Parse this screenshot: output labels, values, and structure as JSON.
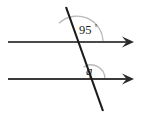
{
  "figure": {
    "background_color": "#ffffff",
    "line_color": "#3b3b3b",
    "transversal_color": "#1a1a1a",
    "arc_color": "#b9b9b9",
    "text_color": "#1c1c1c",
    "labels": {
      "upper_angle_value": "95",
      "upper_angle_degree_symbol": "°",
      "lower_angle_value": "q"
    },
    "lines": {
      "top_parallel": {
        "x1": 8,
        "y1": 42,
        "x2": 138,
        "y2": 42,
        "arrow_end": "right"
      },
      "bottom_parallel": {
        "x1": 8,
        "y1": 79,
        "x2": 138,
        "y2": 79,
        "arrow_end": "right"
      },
      "transversal": {
        "x1": 66,
        "y1": 7,
        "x2": 103,
        "y2": 111
      }
    },
    "intersections": {
      "upper": {
        "x": 77,
        "y": 42
      },
      "lower": {
        "x": 91,
        "y": 79
      }
    },
    "arcs": {
      "upper": {
        "cx": 77,
        "cy": 42,
        "radius": 26
      },
      "lower": {
        "cx": 91,
        "cy": 79,
        "radius": 14
      }
    }
  }
}
